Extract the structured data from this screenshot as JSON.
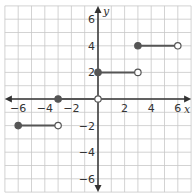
{
  "chart_data": {
    "type": "line",
    "title": "",
    "xlabel": "x",
    "ylabel": "y",
    "xlim": [
      -7,
      7
    ],
    "ylim": [
      -7,
      7
    ],
    "grid": true,
    "x_ticks": [
      -6,
      -4,
      -2,
      2,
      4,
      6
    ],
    "y_ticks": [
      6,
      4,
      2,
      -2,
      -4,
      -6
    ],
    "x_tick_labels": [
      "−6",
      "−4",
      "−2",
      "2",
      "4",
      "6"
    ],
    "y_tick_labels": [
      "6",
      "4",
      "2",
      "−2",
      "−4",
      "−6"
    ],
    "series": [
      {
        "name": "step function",
        "segments": [
          {
            "x_start": -6,
            "x_end": -3,
            "y": -2,
            "start_closed": true,
            "end_closed": false
          },
          {
            "x_start": -3,
            "x_end": 0,
            "y": 0,
            "start_closed": true,
            "end_closed": false
          },
          {
            "x_start": 0,
            "x_end": 3,
            "y": 2,
            "start_closed": true,
            "end_closed": false
          },
          {
            "x_start": 3,
            "x_end": 6,
            "y": 4,
            "start_closed": true,
            "end_closed": false
          }
        ]
      }
    ],
    "colors": {
      "grid": "#c8c8c8",
      "axis": "#333333",
      "line": "#555555",
      "point": "#555555"
    }
  }
}
